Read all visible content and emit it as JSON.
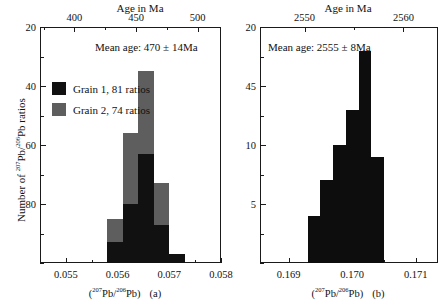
{
  "figure": {
    "panels": [
      {
        "id": "a",
        "label": "(a)",
        "top_axis_title": "Age in Ma",
        "top_ticks": [
          "400",
          "450",
          "500"
        ],
        "bottom_ticks": [
          "0.055",
          "0.056",
          "0.057",
          "0.058"
        ],
        "bottom_axis_caption_pre": "(",
        "bottom_axis_caption_num": "207",
        "bottom_axis_caption_mid": "Pb/",
        "bottom_axis_caption_den": "206",
        "bottom_axis_caption_post": "Pb)",
        "y_ticks": [
          "80",
          "60",
          "40",
          "20"
        ],
        "y_axis_label_pre": "Number of ",
        "y_axis_label_num": "207",
        "y_axis_label_mid": "Pb/",
        "y_axis_label_den": "206",
        "y_axis_label_post": "Pb ratios",
        "annotation": "Mean age: 470 ± 14Ma",
        "legend": [
          {
            "label": "Grain 1, 81 ratios",
            "color": "#111111",
            "series": "grain1"
          },
          {
            "label": "Grain 2, 74 ratios",
            "color": "#5e5e5e",
            "series": "grain2"
          }
        ]
      },
      {
        "id": "b",
        "label": "(b)",
        "top_axis_title": "Age in Ma",
        "top_ticks": [
          "2550",
          "2560"
        ],
        "bottom_ticks": [
          "0.169",
          "0.170",
          "0.171"
        ],
        "bottom_axis_caption_pre": "(",
        "bottom_axis_caption_num": "207",
        "bottom_axis_caption_mid": "Pb/",
        "bottom_axis_caption_den": "206",
        "bottom_axis_caption_post": "Pb)",
        "y_ticks": [
          "20",
          "45",
          "10",
          "5"
        ],
        "annotation": "Mean age: 2555 ± 8Ma"
      }
    ]
  },
  "chart_data": [
    {
      "type": "bar",
      "panel": "a",
      "title": "",
      "xlabel": "(207Pb/206Pb)",
      "xlabel_top": "Age in Ma",
      "ylabel": "Number of 207Pb/206Pb ratios",
      "xlim": [
        0.0545,
        0.058
      ],
      "ylim": [
        0,
        80
      ],
      "xticks": [
        0.055,
        0.056,
        0.057,
        0.058
      ],
      "xticks_top_age": [
        400,
        450,
        500
      ],
      "yticks": [
        20,
        40,
        60,
        80
      ],
      "grid": false,
      "legend_position": "upper-left-inside",
      "stacked": true,
      "bin_edges": [
        0.0558,
        0.0561,
        0.0564,
        0.0567,
        0.057,
        0.0573
      ],
      "bin_centers": [
        0.05595,
        0.05625,
        0.05655,
        0.05685,
        0.05715
      ],
      "series": [
        {
          "name": "Grain 1, 81 ratios",
          "color": "#111111",
          "values": [
            7,
            20,
            37,
            13,
            3
          ]
        },
        {
          "name": "Grain 2, 74 ratios",
          "color": "#5e5e5e",
          "values": [
            8,
            24,
            28,
            14,
            0
          ]
        }
      ],
      "totals": [
        15,
        44,
        65,
        27,
        3
      ],
      "annotation": "Mean age: 470 ± 14Ma"
    },
    {
      "type": "bar",
      "panel": "b",
      "title": "",
      "xlabel": "(207Pb/206Pb)",
      "xlabel_top": "Age in Ma",
      "ylabel": "",
      "xlim": [
        0.16855,
        0.17135
      ],
      "ylim": [
        0,
        20
      ],
      "xticks": [
        0.169,
        0.17,
        0.171
      ],
      "xticks_top_age": [
        2550,
        2560
      ],
      "ytick_labels": [
        "20",
        "45",
        "10",
        "5"
      ],
      "ytick_values": [
        20,
        15,
        10,
        5
      ],
      "grid": false,
      "stacked": false,
      "bin_edges": [
        0.1693,
        0.1695,
        0.1697,
        0.1699,
        0.1701,
        0.1703,
        0.1705
      ],
      "bin_centers": [
        0.1694,
        0.1696,
        0.1698,
        0.17,
        0.1702,
        0.1704
      ],
      "series": [
        {
          "name": "ratios",
          "color": "#0d0d0d",
          "values": [
            4,
            7,
            10,
            13,
            18,
            9
          ]
        }
      ],
      "annotation": "Mean age: 2555 ± 8Ma"
    }
  ]
}
